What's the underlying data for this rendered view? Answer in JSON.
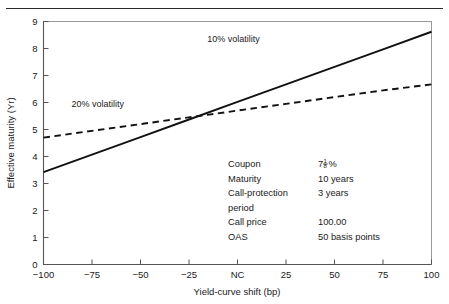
{
  "figure": {
    "top_rule": "horizontal-rule",
    "top_fragment": ""
  },
  "chart_data": {
    "type": "line",
    "title": "",
    "xlabel": "Yield-curve shift (bp)",
    "ylabel": "Effective maturity (Yr)",
    "xlim": [
      -100,
      100
    ],
    "ylim": [
      0,
      9
    ],
    "grid": false,
    "legend_position": "inline-labels",
    "x_tick_labels": [
      "−100",
      "−75",
      "−50",
      "−25",
      "NC",
      "25",
      "50",
      "75",
      "100"
    ],
    "x_tick_values": [
      -100,
      -75,
      -50,
      -25,
      0,
      25,
      50,
      75,
      100
    ],
    "y_tick_labels": [
      "0",
      "1",
      "2",
      "3",
      "4",
      "5",
      "6",
      "7",
      "8",
      "9"
    ],
    "y_tick_values": [
      0,
      1,
      2,
      3,
      4,
      5,
      6,
      7,
      8,
      9
    ],
    "x": [
      -100,
      -75,
      -50,
      -25,
      0,
      25,
      50,
      75,
      100
    ],
    "series": [
      {
        "name": "10% volatility",
        "style": "solid",
        "color": "#111111",
        "values": [
          3.42,
          4.07,
          4.72,
          5.37,
          6.02,
          6.67,
          7.32,
          7.97,
          8.62
        ],
        "label_x": -2,
        "label_y": 8.25
      },
      {
        "name": "20% volatility",
        "style": "dashed",
        "color": "#111111",
        "values": [
          4.7,
          4.95,
          5.2,
          5.45,
          5.7,
          5.95,
          6.2,
          6.45,
          6.67
        ],
        "label_x": -72,
        "label_y": 5.85
      }
    ],
    "annotation_box": {
      "rows": [
        {
          "label": "Coupon",
          "value": "7⅛%",
          "value_kind": "fraction",
          "whole": "7",
          "numerator": "1",
          "denominator": "8",
          "suffix": "%"
        },
        {
          "label": "Maturity",
          "value": "10 years",
          "value_kind": "text"
        },
        {
          "label": "Call-protection",
          "value": "3 years",
          "value_kind": "text"
        },
        {
          "label": "period",
          "value": "",
          "value_kind": "text"
        },
        {
          "label": "Call price",
          "value": "100.00",
          "value_kind": "text"
        },
        {
          "label": "OAS",
          "value": "50 basis points",
          "value_kind": "text"
        }
      ]
    }
  }
}
